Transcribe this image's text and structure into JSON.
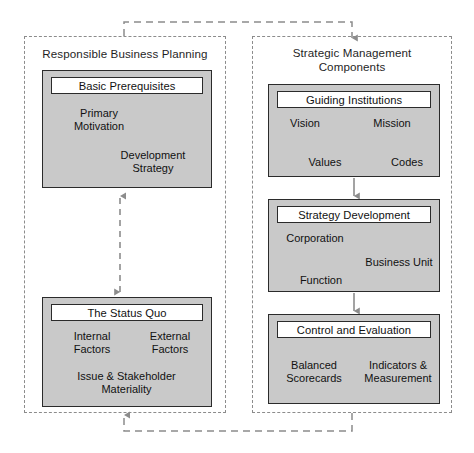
{
  "diagram": {
    "type": "flow-diagram",
    "colors": {
      "box_fill": "#c9c9c9",
      "box_border": "#2b2b2b",
      "header_fill": "#ffffff",
      "panel_border": "#8c8c8c",
      "connector_gray": "#8c8c8c",
      "arrow_black": "#111111",
      "background": "#ffffff"
    }
  },
  "panels": [
    {
      "id": "responsible-business-planning",
      "title": "Responsible Business Planning"
    },
    {
      "id": "strategic-management-components",
      "title": "Strategic Management\nComponents"
    }
  ],
  "boxes": [
    {
      "id": "basic-prerequisites",
      "header": "Basic Prerequisites",
      "panel": "responsible-business-planning",
      "labels": [
        {
          "text": "Primary\nMotivation",
          "align": "left"
        },
        {
          "text": "Development\nStrategy",
          "align": "right"
        }
      ]
    },
    {
      "id": "the-status-quo",
      "header": "The Status Quo",
      "panel": "responsible-business-planning",
      "labels": [
        {
          "text": "Internal\nFactors",
          "align": "left"
        },
        {
          "text": "External\nFactors",
          "align": "right"
        },
        {
          "text": "Issue & Stakeholder\nMateriality",
          "align": "center"
        }
      ]
    },
    {
      "id": "guiding-institutions",
      "header": "Guiding Institutions",
      "panel": "strategic-management-components",
      "labels": [
        {
          "text": "Vision",
          "align": "left"
        },
        {
          "text": "Mission",
          "align": "right"
        },
        {
          "text": "Values",
          "align": "left"
        },
        {
          "text": "Codes",
          "align": "right"
        }
      ],
      "internal_arrows": [
        {
          "from": "Vision",
          "to": "Mission",
          "style": "straight-right"
        },
        {
          "from": "Mission",
          "to": "Values",
          "style": "diagonal-down-left"
        },
        {
          "from": "Values",
          "to": "Codes",
          "style": "straight-right"
        }
      ]
    },
    {
      "id": "strategy-development",
      "header": "Strategy Development",
      "panel": "strategic-management-components",
      "labels": [
        {
          "text": "Corporation",
          "align": "left"
        },
        {
          "text": "Business Unit",
          "align": "right"
        },
        {
          "text": "Function",
          "align": "left"
        }
      ],
      "internal_arrows": [
        {
          "from": "Corporation",
          "to": "Business Unit",
          "style": "diagonal-down-right"
        },
        {
          "from": "Business Unit",
          "to": "Function",
          "style": "diagonal-down-left"
        }
      ]
    },
    {
      "id": "control-and-evaluation",
      "header": "Control and Evaluation",
      "panel": "strategic-management-components",
      "labels": [
        {
          "text": "Balanced\nScorecards",
          "align": "left"
        },
        {
          "text": "Indicators &\nMeasurement",
          "align": "right"
        }
      ],
      "internal_arrows": [
        {
          "from": "Balanced Scorecards",
          "to": "Indicators & Measurement",
          "style": "double-headed"
        }
      ]
    }
  ],
  "connectors": [
    {
      "id": "status-quo-to-basic-prerequisites",
      "from": "the-status-quo",
      "to": "basic-prerequisites",
      "style": "dashed",
      "heads": "double",
      "color": "#8c8c8c"
    },
    {
      "id": "planning-to-strategic-management",
      "from": "responsible-business-planning",
      "to": "strategic-management-components",
      "style": "dashed",
      "heads": "single",
      "direction": "down-into-right-panel",
      "color": "#8c8c8c"
    },
    {
      "id": "strategic-management-to-planning",
      "from": "strategic-management-components",
      "to": "responsible-business-planning",
      "style": "dashed",
      "heads": "single",
      "direction": "up-into-left-panel",
      "color": "#8c8c8c"
    },
    {
      "id": "guiding-to-strategy",
      "from": "guiding-institutions",
      "to": "strategy-development",
      "style": "solid",
      "heads": "single",
      "color": "#8c8c8c"
    },
    {
      "id": "strategy-to-control",
      "from": "strategy-development",
      "to": "control-and-evaluation",
      "style": "solid",
      "heads": "single",
      "color": "#8c8c8c"
    }
  ]
}
